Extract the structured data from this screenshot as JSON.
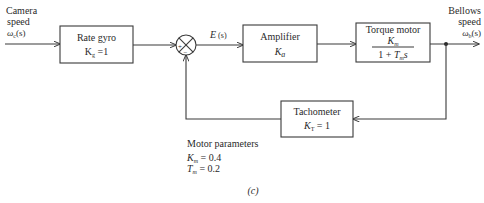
{
  "diagram": {
    "input": {
      "line1": "Camera",
      "line2": "speed",
      "signal": "ω",
      "signal_sub": "c",
      "signal_arg": "(s)"
    },
    "rate_gyro": {
      "title": "Rate gyro",
      "gain_symbol": "K",
      "gain_sub": "g",
      "gain_value": " =1"
    },
    "summing_junction": {
      "plus": "+",
      "minus": "−"
    },
    "error_signal": {
      "symbol": "E",
      "arg": "(s)"
    },
    "amplifier": {
      "title": "Amplifier",
      "gain_symbol": "K",
      "gain_sub": "a"
    },
    "torque_motor": {
      "title": "Torque motor",
      "num_symbol": "K",
      "num_sub": "m",
      "den_prefix": "1 + ",
      "den_symbol": "T",
      "den_sub": "m",
      "den_suffix": "s"
    },
    "output": {
      "line1": "Bellows",
      "line2": "speed",
      "signal": "ω",
      "signal_sub": "b",
      "signal_arg": "(s)"
    },
    "tachometer": {
      "title": "Tachometer",
      "gain_symbol": "K",
      "gain_sub": "T",
      "gain_value": " = 1"
    },
    "motor_parameters": {
      "heading": "Motor parameters",
      "km_symbol": "K",
      "km_sub": "m",
      "km_value": " = 0.4",
      "tm_symbol": "T",
      "tm_sub": "m",
      "tm_value": " = 0.2"
    },
    "caption": "(c)"
  }
}
